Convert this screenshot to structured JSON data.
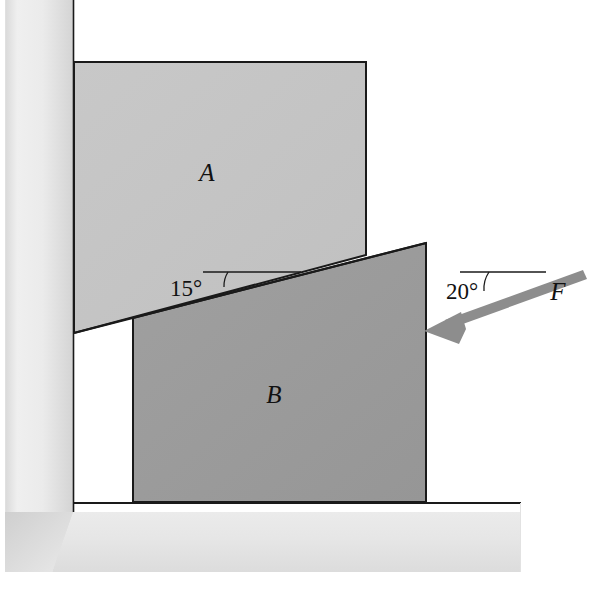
{
  "figure": {
    "background_color": "#ffffff"
  },
  "blocks": [
    {
      "id": "block-a",
      "label": "A",
      "fill": "#c4c4c4",
      "stroke": "#1a1a1a",
      "label_x": 207,
      "label_y": 181
    },
    {
      "id": "block-b",
      "label": "B",
      "fill": "#9b9b9b",
      "stroke": "#1a1a1a",
      "label_x": 274,
      "label_y": 403
    }
  ],
  "angles": [
    {
      "id": "incline-angle",
      "label": "15°",
      "value": 15,
      "unit": "degree",
      "label_x": 186,
      "label_y": 296,
      "ref_line": {
        "x1": 203,
        "y1": 272,
        "x2": 301,
        "y2": 272
      }
    },
    {
      "id": "force-angle",
      "label": "20°",
      "value": 20,
      "unit": "degree",
      "label_x": 462,
      "label_y": 299,
      "ref_line": {
        "x1": 460,
        "y1": 272,
        "x2": 546,
        "y2": 272
      }
    }
  ],
  "force": {
    "id": "applied-force",
    "label": "F",
    "color": "#8d8d8d",
    "label_x": 558,
    "label_y": 300,
    "tail_x": 582,
    "tail_y": 274,
    "tip_x": 424,
    "tip_y": 331
  },
  "surfaces": {
    "wall": {
      "label": "vertical wall",
      "fill_light": "#f2f2f2",
      "fill_dark": "#d2d2d2",
      "stroke": "#1a1a1a"
    },
    "ground": {
      "label": "ground",
      "fill_light": "#f1f1f1",
      "fill_dark": "#d8d8d8",
      "stroke": "#1a1a1a"
    }
  },
  "colors": {
    "block_a": "#c4c4c4",
    "block_b": "#9b9b9b",
    "force_arrow": "#8d8d8d",
    "outline": "#1a1a1a",
    "hatch": "#e7e7e7"
  }
}
